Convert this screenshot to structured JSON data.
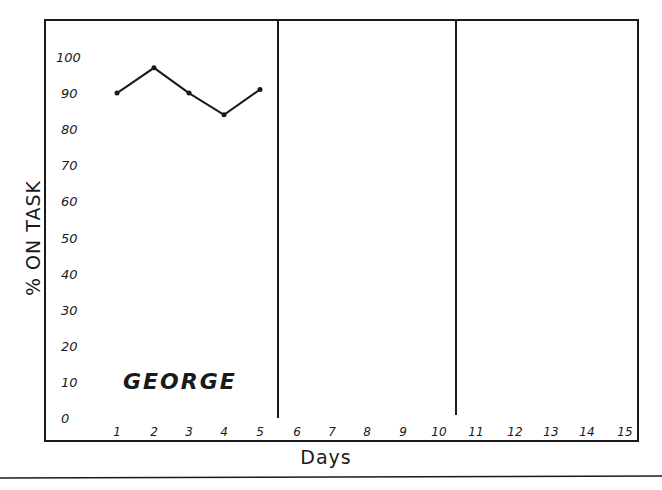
{
  "chart_data": {
    "type": "line",
    "title": "",
    "subject": "GEORGE",
    "xlabel": "Days",
    "ylabel": "% ON TASK",
    "x": [
      1,
      2,
      3,
      4,
      5,
      6,
      7,
      8,
      9,
      10,
      11,
      12,
      13,
      14,
      15
    ],
    "x_tick_labels": [
      "1",
      "2",
      "3",
      "4",
      "5",
      "6",
      "7",
      "8",
      "9",
      "10",
      "11",
      "12",
      "13",
      "14",
      "15"
    ],
    "y_tick_labels": [
      "0",
      "10",
      "20",
      "30",
      "40",
      "50",
      "60",
      "70",
      "80",
      "90",
      "100"
    ],
    "ylim": [
      0,
      100
    ],
    "xlim": [
      1,
      15
    ],
    "grid": false,
    "phase_change_lines_after_days": [
      5,
      10
    ],
    "series": [
      {
        "name": "GEORGE",
        "x": [
          1,
          2,
          3,
          4,
          5
        ],
        "values": [
          90,
          97,
          90,
          84,
          91
        ]
      }
    ],
    "legend": null,
    "colors": {
      "line": "#1a1a1a",
      "background": "#ffffff"
    }
  }
}
